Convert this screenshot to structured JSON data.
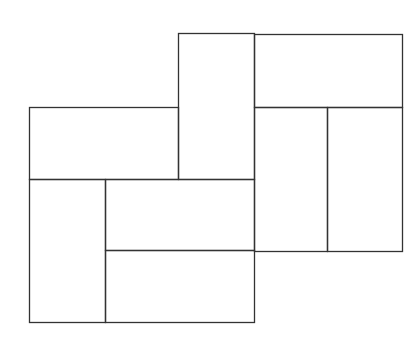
{
  "diagram": {
    "stroke_color": "#333333",
    "background": "#ffffff",
    "rectangles": [
      {
        "id": "center-tall",
        "x": 178,
        "y": 33,
        "w": 76,
        "h": 146
      },
      {
        "id": "top-right",
        "x": 254,
        "y": 34,
        "w": 148,
        "h": 73
      },
      {
        "id": "left-top",
        "x": 29,
        "y": 107,
        "w": 149,
        "h": 72
      },
      {
        "id": "right-tall-a",
        "x": 254,
        "y": 107,
        "w": 73,
        "h": 144
      },
      {
        "id": "right-tall-b",
        "x": 327,
        "y": 107,
        "w": 75,
        "h": 144
      },
      {
        "id": "bottom-left-tall",
        "x": 29,
        "y": 179,
        "w": 76,
        "h": 143
      },
      {
        "id": "middle",
        "x": 105,
        "y": 179,
        "w": 149,
        "h": 71
      },
      {
        "id": "bottom",
        "x": 105,
        "y": 250,
        "w": 149,
        "h": 72
      }
    ]
  }
}
